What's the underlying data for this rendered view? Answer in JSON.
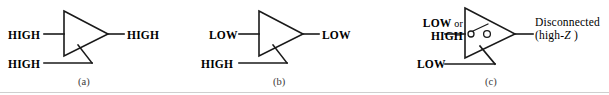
{
  "figure": {
    "type": "logic-diagram",
    "stroke_color": "#1a1a1a",
    "rule_color": "#cfcfcf"
  },
  "panels": [
    {
      "id": "a",
      "caption": "(a)",
      "gate": "tri-state-buffer",
      "data_input_label": "HIGH",
      "enable_input_label": "HIGH",
      "output_label": "HIGH",
      "state": "enabled"
    },
    {
      "id": "b",
      "caption": "(b)",
      "gate": "tri-state-buffer",
      "data_input_label": "LOW",
      "enable_input_label": "HIGH",
      "output_label": "LOW",
      "state": "enabled"
    },
    {
      "id": "c",
      "caption": "(c)",
      "gate": "tri-state-buffer",
      "data_input_label_line1": "LOW",
      "data_input_label_or": "or",
      "data_input_label_line2": "HIGH",
      "enable_input_label": "LOW",
      "output_label_line1": "Disconnected",
      "output_label_line2_prefix": "(high-",
      "output_label_line2_italic": "Z",
      "output_label_line2_suffix": " )",
      "state": "high-impedance",
      "internal_symbol": "open-switch"
    }
  ]
}
